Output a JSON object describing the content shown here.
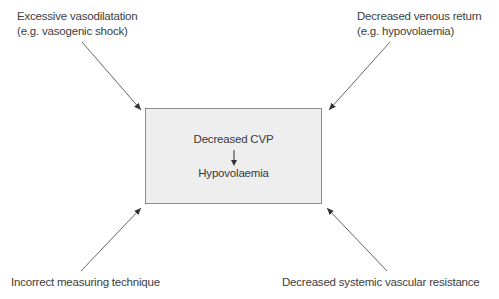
{
  "diagram": {
    "center_box": {
      "top_text": "Decreased CVP",
      "bottom_text": "Hypovolaemia",
      "fill": "#eeeeee",
      "border": "#8c8c8c"
    },
    "causes": [
      {
        "line1": "Excessive vasodilatation",
        "line2": "(e.g. vasogenic shock)",
        "position": "top-left"
      },
      {
        "line1": "Decreased venous return",
        "line2": "(e.g. hypovolaemia)",
        "position": "top-right"
      },
      {
        "line1": "Incorrect measuring technique",
        "position": "bottom-left"
      },
      {
        "line1": "Decreased systemic vascular resistance",
        "position": "bottom-right"
      }
    ],
    "arrow_color": "#555555"
  }
}
